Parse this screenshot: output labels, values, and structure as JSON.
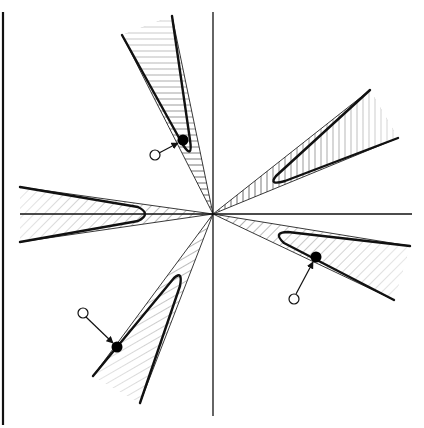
{
  "diagram": {
    "type": "geometric-construction",
    "canvas": {
      "width": 424,
      "height": 428
    },
    "colors": {
      "background": "#ffffff",
      "stroke": "#111111",
      "hatch": "#333333",
      "point_filled": "#000000",
      "point_open_fill": "#ffffff"
    },
    "origin": {
      "x": 213,
      "y": 214
    },
    "axes": {
      "vertical": {
        "x": 213,
        "y1": 12,
        "y2": 416
      },
      "horizontal": {
        "y": 214,
        "x1": 20,
        "x2": 412
      }
    },
    "border": {
      "x": 3,
      "y1": 12,
      "y2": 425
    },
    "wedges": [
      {
        "name": "upper-left",
        "rays": [
          [
            122,
            35
          ],
          [
            172,
            16
          ]
        ],
        "curve": "M122,35 L185,148 Q193,156 190,140 L172,16",
        "hatch_angle": 0
      },
      {
        "name": "upper-right",
        "rays": [
          [
            370,
            90
          ],
          [
            398,
            138
          ]
        ],
        "curve": "M370,90 L276,176 Q270,184 285,180 L398,138",
        "hatch_angle": 90
      },
      {
        "name": "left",
        "rays": [
          [
            20,
            187
          ],
          [
            20,
            242
          ]
        ],
        "curve": "M20,187 L140,208 Q152,214 140,220 L20,242",
        "hatch_angle": 45
      },
      {
        "name": "right",
        "rays": [
          [
            410,
            246
          ],
          [
            394,
            300
          ]
        ],
        "curve": "M410,246 L288,232 Q272,232 285,244 L394,300",
        "hatch_angle": 45
      },
      {
        "name": "lower-left",
        "rays": [
          [
            93,
            376
          ],
          [
            140,
            403
          ]
        ],
        "curve": "M93,376 L175,278 Q182,272 180,285 L140,403",
        "hatch_angle": -60
      }
    ],
    "projections": [
      {
        "open": {
          "x": 155,
          "y": 155
        },
        "filled": {
          "x": 183,
          "y": 140
        }
      },
      {
        "open": {
          "x": 83,
          "y": 313
        },
        "filled": {
          "x": 117,
          "y": 347
        }
      },
      {
        "open": {
          "x": 294,
          "y": 299
        },
        "filled": {
          "x": 316,
          "y": 257
        }
      }
    ]
  }
}
